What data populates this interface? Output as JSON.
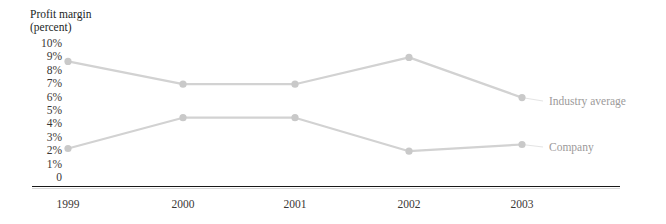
{
  "chart_data": {
    "type": "line",
    "title": "",
    "ylabel": "Profit margin (percent)",
    "ylabel_line1": "Profit margin",
    "ylabel_line2": "(percent)",
    "xlabel": "",
    "categories": [
      "1999",
      "2000",
      "2001",
      "2002",
      "2003"
    ],
    "ytick_labels": [
      "10%",
      "9%",
      "8%",
      "7%",
      "6%",
      "5%",
      "4%",
      "3%",
      "2%",
      "1%",
      "0"
    ],
    "ytick_values": [
      10,
      9,
      8,
      7,
      6,
      5,
      4,
      3,
      2,
      1,
      0
    ],
    "ylim": [
      0,
      10
    ],
    "grid": false,
    "legend_position": "right-of-plot",
    "series": [
      {
        "name": "Industry average",
        "values": [
          8.7,
          7.0,
          7.0,
          9.0,
          6.0
        ],
        "color": "#d2d2d2"
      },
      {
        "name": "Company",
        "values": [
          2.2,
          4.5,
          4.5,
          2.0,
          2.5
        ],
        "color": "#d2d2d2"
      }
    ],
    "annotations": []
  },
  "legend": {
    "industry_average": "Industry average",
    "company": "Company"
  },
  "colors": {
    "series_line": "#d2d2d2",
    "marker": "#c9c9c9",
    "axis": "#191919",
    "tick_text": "#3a3736",
    "legend_text": "#9c9a9a",
    "background": "#ffffff"
  }
}
